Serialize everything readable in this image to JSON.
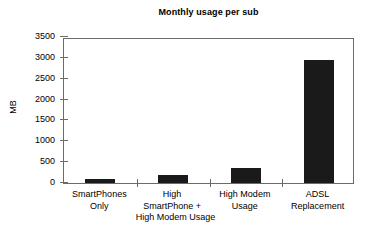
{
  "chart_data": {
    "type": "bar",
    "title": "Monthly usage per sub",
    "xlabel": "",
    "ylabel": "MB",
    "categories": [
      "SmartPhones Only",
      "High SmartPhone + High Modem Usage",
      "High Modem Usage",
      "ADSL Replacement"
    ],
    "category_lines": [
      [
        "SmartPhones",
        "Only"
      ],
      [
        "High",
        "SmartPhone +",
        "High Modem Usage"
      ],
      [
        "High Modem",
        "Usage"
      ],
      [
        "ADSL",
        "Replacement"
      ]
    ],
    "values": [
      95,
      190,
      360,
      2960
    ],
    "ylim": [
      0,
      3500
    ],
    "ytick_values": [
      0,
      500,
      1000,
      1500,
      2000,
      2500,
      3000,
      3500
    ],
    "ytick_labels": [
      "0",
      "500",
      "1000",
      "1500",
      "2000",
      "2500",
      "3000",
      "3500"
    ],
    "grid": false,
    "legend": "none",
    "bar_color": "#1a1a1a",
    "axis_color": "#6b6b6b",
    "background_color": "#ffffff"
  }
}
